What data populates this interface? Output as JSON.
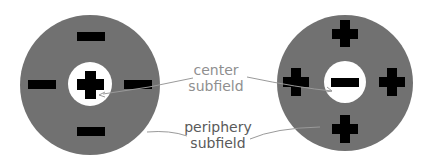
{
  "diagram": {
    "title": "",
    "colors": {
      "periphery": "#717171",
      "center": "#ffffff",
      "symbol": "#000000",
      "leader_line": "#9a9a9a",
      "label_center": "#8f8f8f",
      "label_periphery": "#5a5a5a"
    },
    "left_field": {
      "center_sign": "+",
      "periphery_signs": [
        "-",
        "-",
        "-",
        "-"
      ]
    },
    "right_field": {
      "center_sign": "-",
      "periphery_signs": [
        "+",
        "+",
        "+",
        "+"
      ]
    },
    "labels": {
      "center_line1": "center",
      "center_line2": "subfield",
      "periphery_line1": "periphery",
      "periphery_line2": "subfield"
    }
  }
}
